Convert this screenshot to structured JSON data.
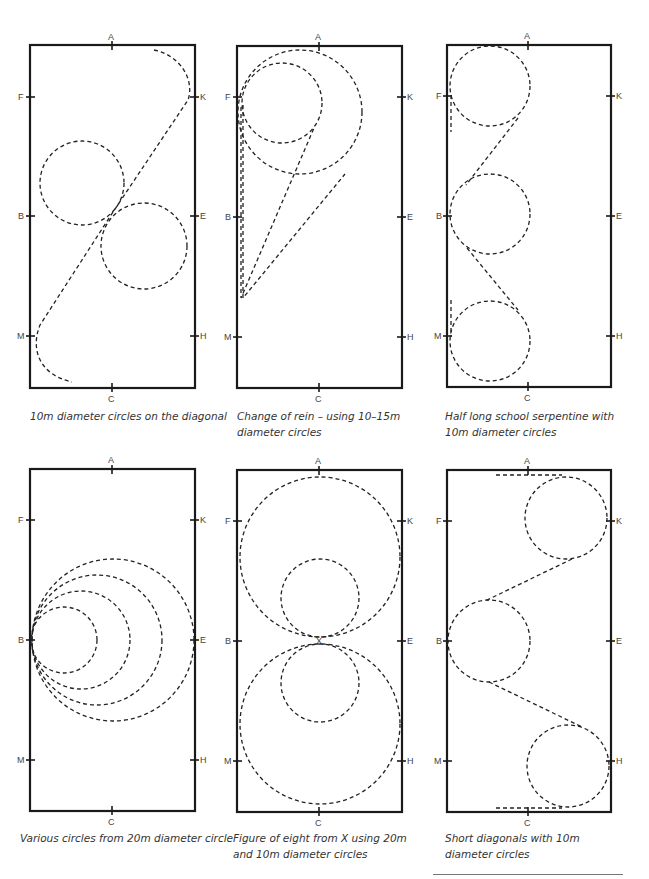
{
  "figures": [
    {
      "id": "diagonal-circles",
      "caption": "10m diameter circles on the diagonal"
    },
    {
      "id": "change-of-rein",
      "caption": "Change of rein – using 10–15m diameter circles"
    },
    {
      "id": "half-serpentine",
      "caption": "Half long school serpentine with 10m diameter circles"
    },
    {
      "id": "various-circles",
      "caption": "Various circles from 20m diameter circle"
    },
    {
      "id": "figure-of-eight",
      "caption": "Figure of eight from X using 20m and 10m diameter circles"
    },
    {
      "id": "short-diagonals",
      "caption": "Short diagonals with 10m diameter circles"
    }
  ],
  "markers": {
    "top": "A",
    "bottom": "C",
    "left": [
      "F",
      "B",
      "M"
    ],
    "right": [
      "K",
      "E",
      "H"
    ],
    "center": "X"
  },
  "colors": {
    "line": "#1a1a1a",
    "caption": "#333333",
    "background": "#ffffff"
  }
}
